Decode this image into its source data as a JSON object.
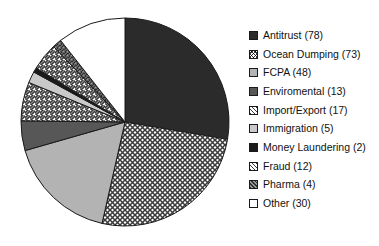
{
  "chart_data": {
    "type": "pie",
    "title": "",
    "subtitle": "",
    "xlabel": "",
    "ylabel": "",
    "total": 282,
    "start_angle_deg": 0,
    "direction": "clockwise",
    "legend_position": "right",
    "grid": false,
    "categories": [
      "Antitrust",
      "Ocean Dumping",
      "FCPA",
      "Enviromental",
      "Import/Export",
      "Immigration",
      "Money Laundering",
      "Fraud",
      "Pharma",
      "Other"
    ],
    "values": [
      78,
      73,
      48,
      13,
      17,
      5,
      2,
      12,
      4,
      30
    ],
    "slices": [
      {
        "label": "Antitrust",
        "value": 78,
        "legend_text": "Antitrust (78)",
        "pattern": "solid-black",
        "fill": "#2b2b2b"
      },
      {
        "label": "Ocean Dumping",
        "value": 73,
        "legend_text": "Ocean Dumping (73)",
        "pattern": "cross-hatch",
        "fill": "#ffffff"
      },
      {
        "label": "FCPA",
        "value": 48,
        "legend_text": "FCPA (48)",
        "pattern": "solid-light-gray",
        "fill": "#b3b3b3"
      },
      {
        "label": "Enviromental",
        "value": 13,
        "legend_text": "Enviromental (13)",
        "pattern": "solid-dark-gray",
        "fill": "#575757"
      },
      {
        "label": "Import/Export",
        "value": 17,
        "legend_text": "Import/Export (17)",
        "pattern": "diagonal-forward",
        "fill": "#ffffff"
      },
      {
        "label": "Immigration",
        "value": 5,
        "legend_text": "Immigration (5)",
        "pattern": "solid-pale-gray",
        "fill": "#c9c9c9"
      },
      {
        "label": "Money Laundering",
        "value": 2,
        "legend_text": "Money Laundering (2)",
        "pattern": "solid-black",
        "fill": "#1a1a1a"
      },
      {
        "label": "Fraud",
        "value": 12,
        "legend_text": "Fraud (12)",
        "pattern": "diagonal-back",
        "fill": "#ffffff"
      },
      {
        "label": "Pharma",
        "value": 4,
        "legend_text": "Pharma (4)",
        "pattern": "dense-hatch",
        "fill": "#8f8f8f"
      },
      {
        "label": "Other",
        "value": 30,
        "legend_text": "Other (30)",
        "pattern": "none-white",
        "fill": "#ffffff"
      }
    ]
  },
  "colors": {
    "outline": "#1a1a1a",
    "background": "#ffffff",
    "text": "#111111"
  },
  "geometry": {
    "center_x": 125,
    "center_y": 122,
    "radius": 104
  }
}
